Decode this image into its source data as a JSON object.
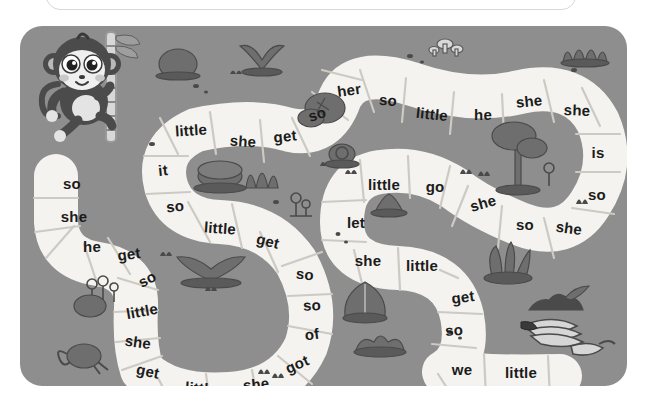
{
  "page": {
    "background_color": "#ffffff",
    "board_color": "#8e8e8e",
    "path_color": "#f4f3ef",
    "path_divider_color": "#cfcdc7",
    "text_color": "#1b1b1b"
  },
  "top_panel": {
    "name": "top-rounded-panel",
    "border_color": "#d8d8d8",
    "fill_color": "#ffffff"
  },
  "board": {
    "title": "",
    "character_icon": "monkey-icon",
    "end_icon": "bananas-icon",
    "scenery": [
      "rock-icon",
      "plant-icon",
      "grass-icon",
      "tree-icon",
      "mushroom-icon",
      "bush-icon",
      "cactus-icon",
      "leaf-icon",
      "stump-icon",
      "snail-icon",
      "chameleon-icon",
      "flower-icon",
      "log-icon",
      "sprout-icon",
      "berry-bush-icon"
    ],
    "tiles": [
      {
        "id": 1,
        "word": "so",
        "x": 52,
        "y": 157,
        "rot": 0
      },
      {
        "id": 2,
        "word": "she",
        "x": 54,
        "y": 190,
        "rot": 0
      },
      {
        "id": 3,
        "word": "he",
        "x": 72,
        "y": 220,
        "rot": 0
      },
      {
        "id": 4,
        "word": "get",
        "x": 109,
        "y": 228,
        "rot": -8
      },
      {
        "id": 5,
        "word": "so",
        "x": 127,
        "y": 253,
        "rot": -28
      },
      {
        "id": 6,
        "word": "little",
        "x": 122,
        "y": 285,
        "rot": -10
      },
      {
        "id": 7,
        "word": "she",
        "x": 118,
        "y": 316,
        "rot": 8
      },
      {
        "id": 8,
        "word": "get",
        "x": 128,
        "y": 345,
        "rot": 12
      },
      {
        "id": 9,
        "word": "little",
        "x": 181,
        "y": 362,
        "rot": 4
      },
      {
        "id": 10,
        "word": "she",
        "x": 236,
        "y": 358,
        "rot": -6
      },
      {
        "id": 11,
        "word": "got",
        "x": 277,
        "y": 338,
        "rot": -24
      },
      {
        "id": 12,
        "word": "of",
        "x": 292,
        "y": 308,
        "rot": -8
      },
      {
        "id": 13,
        "word": "so",
        "x": 292,
        "y": 279,
        "rot": -2
      },
      {
        "id": 14,
        "word": "so",
        "x": 285,
        "y": 248,
        "rot": 6
      },
      {
        "id": 15,
        "word": "get",
        "x": 248,
        "y": 215,
        "rot": 14
      },
      {
        "id": 16,
        "word": "little",
        "x": 200,
        "y": 202,
        "rot": 4
      },
      {
        "id": 17,
        "word": "so",
        "x": 155,
        "y": 180,
        "rot": -6
      },
      {
        "id": 18,
        "word": "it",
        "x": 143,
        "y": 144,
        "rot": -6
      },
      {
        "id": 19,
        "word": "little",
        "x": 171,
        "y": 104,
        "rot": -4
      },
      {
        "id": 20,
        "word": "she",
        "x": 223,
        "y": 115,
        "rot": 4
      },
      {
        "id": 21,
        "word": "get",
        "x": 265,
        "y": 110,
        "rot": -6
      },
      {
        "id": 22,
        "word": "so",
        "x": 297,
        "y": 88,
        "rot": -18
      },
      {
        "id": 23,
        "word": "her",
        "x": 329,
        "y": 64,
        "rot": -8
      },
      {
        "id": 24,
        "word": "so",
        "x": 368,
        "y": 74,
        "rot": 4
      },
      {
        "id": 25,
        "word": "little",
        "x": 412,
        "y": 88,
        "rot": 6
      },
      {
        "id": 26,
        "word": "he",
        "x": 463,
        "y": 88,
        "rot": 0
      },
      {
        "id": 27,
        "word": "she",
        "x": 509,
        "y": 75,
        "rot": -6
      },
      {
        "id": 28,
        "word": "she",
        "x": 557,
        "y": 84,
        "rot": 2
      },
      {
        "id": 29,
        "word": "is",
        "x": 578,
        "y": 126,
        "rot": 0
      },
      {
        "id": 30,
        "word": "so",
        "x": 577,
        "y": 168,
        "rot": 0
      },
      {
        "id": 31,
        "word": "she",
        "x": 549,
        "y": 202,
        "rot": 8
      },
      {
        "id": 32,
        "word": "so",
        "x": 505,
        "y": 198,
        "rot": 0
      },
      {
        "id": 33,
        "word": "she",
        "x": 463,
        "y": 177,
        "rot": -16
      },
      {
        "id": 34,
        "word": "go",
        "x": 415,
        "y": 160,
        "rot": 0
      },
      {
        "id": 35,
        "word": "little",
        "x": 364,
        "y": 158,
        "rot": 0
      },
      {
        "id": 36,
        "word": "let",
        "x": 336,
        "y": 196,
        "rot": 0
      },
      {
        "id": 37,
        "word": "she",
        "x": 348,
        "y": 234,
        "rot": 0
      },
      {
        "id": 38,
        "word": "little",
        "x": 402,
        "y": 239,
        "rot": 0
      },
      {
        "id": 39,
        "word": "get",
        "x": 443,
        "y": 271,
        "rot": -8
      },
      {
        "id": 40,
        "word": "so",
        "x": 434,
        "y": 304,
        "rot": -4
      },
      {
        "id": 41,
        "word": "we",
        "x": 442,
        "y": 343,
        "rot": 0
      },
      {
        "id": 42,
        "word": "little",
        "x": 501,
        "y": 346,
        "rot": 0
      }
    ]
  }
}
